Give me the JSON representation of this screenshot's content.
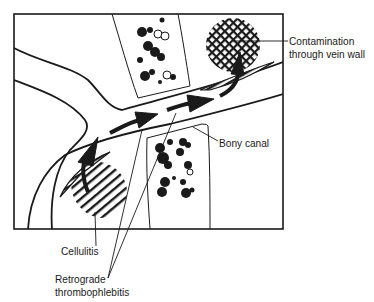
{
  "figure": {
    "type": "anatomical-diagram",
    "colors": {
      "ink": "#1a1a1a",
      "background": "#ffffff"
    }
  },
  "labels": {
    "contamination": {
      "line1": "Contamination",
      "line2": "through vein wall"
    },
    "bony_canal": "Bony canal",
    "cellulitis": "Cellulitis",
    "thrombophlebitis": {
      "line1": "Retrograde",
      "line2": "thrombophlebitis"
    }
  },
  "legend_regions": [
    {
      "name": "contamination-zone",
      "pattern": "crosshatch"
    },
    {
      "name": "cellulitis-zone",
      "pattern": "diagonal-lines"
    },
    {
      "name": "thrombus",
      "pattern": "striped-wedge"
    },
    {
      "name": "bone-marrow",
      "pattern": "dotted-clusters"
    },
    {
      "name": "flow-arrows",
      "pattern": "solid-arrows"
    }
  ]
}
